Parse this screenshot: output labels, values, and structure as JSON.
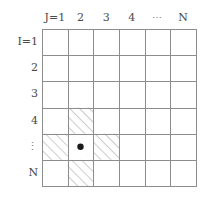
{
  "figure": {
    "grid": {
      "rows": 6,
      "cols": 6,
      "x0": 42,
      "y0": 29,
      "x1": 196,
      "y1": 186,
      "line_color": "#8d8d8d",
      "hatch_color": "#9a9a9a",
      "background": "#ffffff"
    },
    "column_headers": [
      {
        "label": "J=1",
        "col": 1,
        "is_ellipsis": false
      },
      {
        "label": "2",
        "col": 2,
        "is_ellipsis": false
      },
      {
        "label": "3",
        "col": 3,
        "is_ellipsis": false
      },
      {
        "label": "4",
        "col": 4,
        "is_ellipsis": false
      },
      {
        "label": "⋯",
        "col": 5,
        "is_ellipsis": true
      },
      {
        "label": "N",
        "col": 6,
        "is_ellipsis": false
      }
    ],
    "row_headers": [
      {
        "label": "I=1",
        "row": 1,
        "is_ellipsis": false
      },
      {
        "label": "2",
        "row": 2,
        "is_ellipsis": false
      },
      {
        "label": "3",
        "row": 3,
        "is_ellipsis": false
      },
      {
        "label": "4",
        "row": 4,
        "is_ellipsis": false
      },
      {
        "label": "⋮",
        "row": 5,
        "is_ellipsis": true
      },
      {
        "label": "N",
        "row": 6,
        "is_ellipsis": false
      }
    ],
    "hatched_cells": [
      {
        "row": 4,
        "col": 2
      },
      {
        "row": 5,
        "col": 1
      },
      {
        "row": 5,
        "col": 3
      },
      {
        "row": 6,
        "col": 2
      }
    ],
    "marked_cell": {
      "row": 5,
      "col": 2,
      "marker": "dot",
      "marker_color": "#1a1a1a",
      "marker_radius": 3.2
    }
  }
}
